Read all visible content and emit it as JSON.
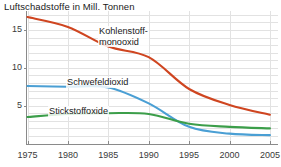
{
  "chart": {
    "title": "Luftschadstoffe in Mill. Tonnen"
  },
  "chart_data": {
    "type": "line",
    "title": "Luftschadstoffe in Mill. Tonnen",
    "xlabel": "",
    "ylabel": "Mill. Tonnen",
    "x": [
      1975,
      1980,
      1985,
      1990,
      1995,
      2000,
      2005
    ],
    "xlim": [
      1975,
      2006
    ],
    "ylim": [
      0,
      17.5
    ],
    "yticks": [
      5,
      10,
      15
    ],
    "ytick_labels": [
      "5",
      "10",
      "15"
    ],
    "xtick_labels": [
      "1975",
      "1980",
      "1985",
      "1990",
      "1995",
      "2000",
      "2005"
    ],
    "grid": true,
    "legend": "inline-labels",
    "series": [
      {
        "name": "Kohlenstoff-\nmonooxid",
        "label_line1": "Kohlenstoff-",
        "label_line2": "monooxid",
        "color": "#cf4520",
        "x": [
          1975,
          1980,
          1985,
          1990,
          1995,
          2000,
          2005
        ],
        "values": [
          16.7,
          15.4,
          12.8,
          11.4,
          7.2,
          5.1,
          3.8
        ]
      },
      {
        "name": "Schwefeldioxid",
        "color": "#4a9fd4",
        "x": [
          1975,
          1980,
          1985,
          1990,
          1995,
          2000,
          2005
        ],
        "values": [
          7.6,
          7.5,
          7.4,
          5.3,
          2.2,
          1.3,
          1.1
        ]
      },
      {
        "name": "Stickstoffoxide",
        "color": "#3c9e4a",
        "x": [
          1975,
          1980,
          1985,
          1990,
          1995,
          2000,
          2005
        ],
        "values": [
          3.5,
          3.9,
          4.0,
          3.9,
          2.6,
          2.2,
          2.0
        ]
      }
    ]
  },
  "colors": {
    "kohlenstoffmonooxid": "#cf4520",
    "schwefeldioxid": "#4a9fd4",
    "stickstoffoxide": "#3c9e4a",
    "grid": "#e2e2e2",
    "axis": "#8a8a8a",
    "text": "#1a1a1a",
    "background": "#ffffff"
  }
}
